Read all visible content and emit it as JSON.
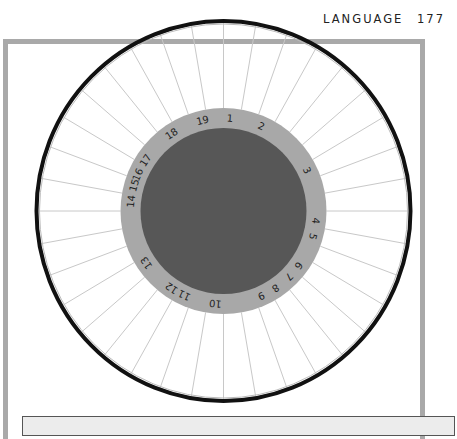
{
  "header": {
    "title": "LANGUAGE",
    "page_number": "177"
  },
  "diagram": {
    "type": "circular-wheel",
    "center": [
      223.5,
      211
    ],
    "outer_rim": {
      "rx": 187,
      "ry": 190,
      "color": "#111111"
    },
    "spokes": {
      "count": 36,
      "interval_deg": 10,
      "color": "#c8c8c8"
    },
    "label_ring": {
      "outer_radius": 103,
      "inner_radius": 83,
      "color": "#a8a8a8"
    },
    "hub": {
      "radius": 83,
      "color": "#575757"
    },
    "labels": [
      {
        "text": "1",
        "angle": 4
      },
      {
        "text": "2",
        "angle": 24
      },
      {
        "text": "3",
        "angle": 64
      },
      {
        "text": "4",
        "angle": 96
      },
      {
        "text": "5",
        "angle": 106
      },
      {
        "text": "6",
        "angle": 126
      },
      {
        "text": "7",
        "angle": 135
      },
      {
        "text": "8",
        "angle": 146
      },
      {
        "text": "9",
        "angle": 156
      },
      {
        "text": "10",
        "angle": 185
      },
      {
        "text": "11",
        "angle": 205
      },
      {
        "text": "12",
        "angle": 214
      },
      {
        "text": "13",
        "angle": 236
      },
      {
        "text": "14",
        "angle": 276
      },
      {
        "text": "15",
        "angle": 286
      },
      {
        "text": "16",
        "angle": 293
      },
      {
        "text": "17",
        "angle": 303
      },
      {
        "text": "18",
        "angle": 326
      },
      {
        "text": "19",
        "angle": 347
      }
    ]
  },
  "colors": {
    "frame": "#a9a9a9",
    "caption_box_bg": "#ececec"
  }
}
